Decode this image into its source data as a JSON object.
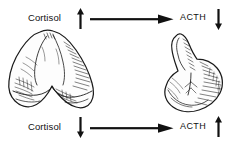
{
  "diagram": {
    "background_color": "#ffffff",
    "ink_color": "#111111",
    "rows": [
      {
        "id": "top",
        "source_label": "Cortisol",
        "source_trend_icon": "arrow-up-icon",
        "source_trend": "up",
        "connector_icon": "arrow-right-icon",
        "target_label": "ACTH",
        "target_trend_icon": "arrow-down-icon",
        "target_trend": "down"
      },
      {
        "id": "bottom",
        "source_label": "Cortisol",
        "source_trend_icon": "arrow-down-icon",
        "source_trend": "down",
        "connector_icon": "arrow-right-icon",
        "target_label": "ACTH",
        "target_trend_icon": "arrow-up-icon",
        "target_trend": "up"
      }
    ],
    "illustrations": [
      {
        "id": "adrenal",
        "name": "adrenal-gland-illustration",
        "description": "Pyramidal adrenal gland with notched inferior border, pen-and-ink hatching"
      },
      {
        "id": "pituitary",
        "name": "pituitary-gland-illustration",
        "description": "Pituitary gland with infundibular stalk and rounded bilobed body, pen-and-ink hatching"
      }
    ]
  }
}
